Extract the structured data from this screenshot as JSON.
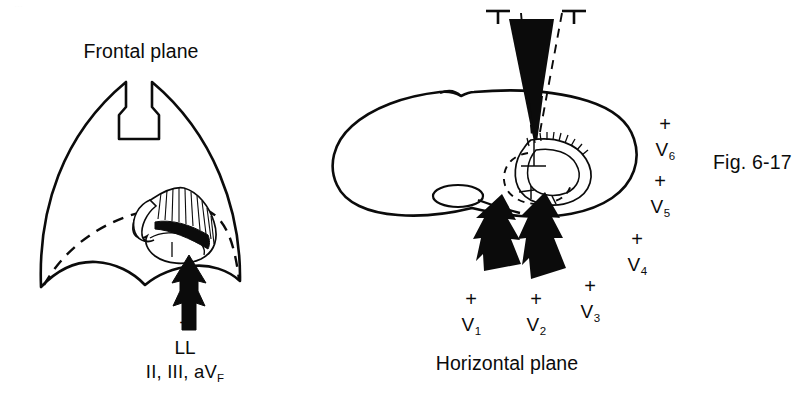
{
  "figure": {
    "caption": "Fig. 6-17",
    "background_color": "#ffffff",
    "ink_color": "#0b0b0b",
    "page_artifact_text": "…"
  },
  "panels": [
    {
      "id": "frontal",
      "title": "Frontal plane",
      "torso_view": "anterior chest silhouette with sternal notch",
      "heart": "cut-away heart with shaded left-ventricular wall",
      "horizontal_reference": "dashed horizontal-plane trace",
      "arrow": {
        "name": "lower-limb-vector-arrow",
        "direction": "up",
        "polarity": "+"
      },
      "labels": {
        "polarity": "+",
        "electrode": "LL",
        "leads": "II, III, aV",
        "leads_sub": "F"
      }
    },
    {
      "id": "horizontal",
      "title": "Horizontal plane",
      "torso_view": "cross-section of thorax at ventricular level",
      "heart": "transverse heart section; solid left ventricle, dashed right ventricle",
      "frontal_reference": "dashed frontal-plane cone with T end-markers",
      "vertical_arrow": {
        "name": "frontal-plane-vector-arrow",
        "direction": "down",
        "polarity": ""
      },
      "arrows": [
        {
          "name": "v1-vector-arrow",
          "direction": "up-left"
        },
        {
          "name": "v2-vector-arrow",
          "direction": "up-left"
        }
      ],
      "precordial_leads": [
        {
          "polarity": "+",
          "label": "V",
          "sub": "1",
          "x": 471,
          "plus_y": 289,
          "label_y": 315
        },
        {
          "polarity": "+",
          "label": "V",
          "sub": "2",
          "x": 536,
          "plus_y": 289,
          "label_y": 315
        },
        {
          "polarity": "+",
          "label": "V",
          "sub": "3",
          "x": 590,
          "plus_y": 276,
          "label_y": 302
        },
        {
          "polarity": "+",
          "label": "V",
          "sub": "4",
          "x": 637,
          "plus_y": 229,
          "label_y": 255
        },
        {
          "polarity": "+",
          "label": "V",
          "sub": "5",
          "x": 660,
          "plus_y": 171,
          "label_y": 197
        },
        {
          "polarity": "+",
          "label": "V",
          "sub": "6",
          "x": 665,
          "plus_y": 114,
          "label_y": 140
        }
      ]
    }
  ]
}
